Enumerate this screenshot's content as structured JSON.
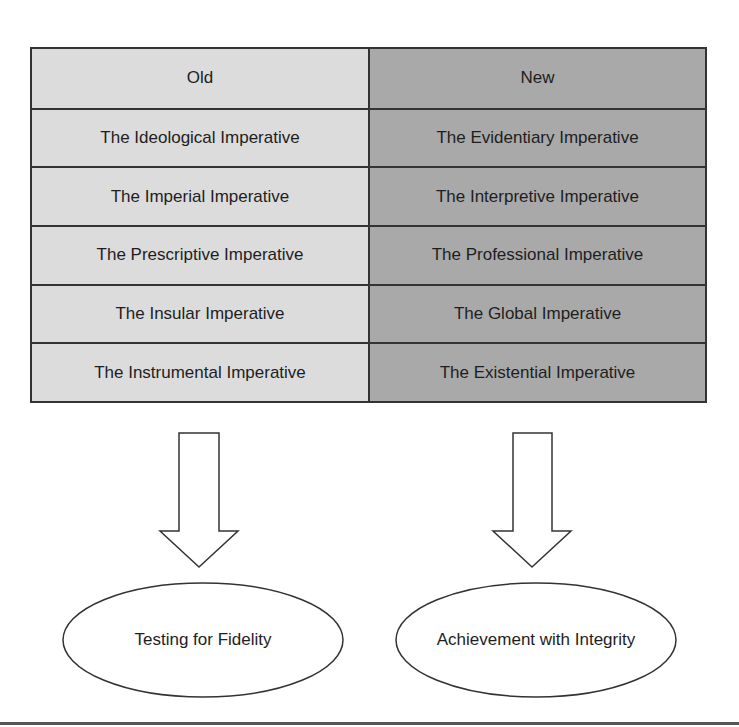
{
  "table": {
    "headers": {
      "old": "Old",
      "new": "New"
    },
    "rows": [
      {
        "old": "The Ideological Imperative",
        "new": "The Evidentiary Imperative"
      },
      {
        "old": "The Imperial Imperative",
        "new": "The Interpretive Imperative"
      },
      {
        "old": "The Prescriptive Imperative",
        "new": "The Professional Imperative"
      },
      {
        "old": "The Insular Imperative",
        "new": "The Global Imperative"
      },
      {
        "old": "The Instrumental Imperative",
        "new": "The Existential Imperative"
      }
    ],
    "colors": {
      "old": "#dcdcdc",
      "new": "#a9a9a9",
      "border": "#333333"
    }
  },
  "outcomes": {
    "old": "Testing for Fidelity",
    "new": "Achievement with Integrity"
  }
}
